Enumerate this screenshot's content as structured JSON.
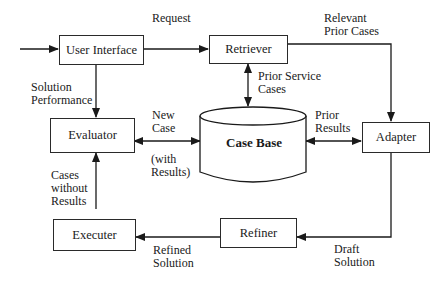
{
  "diagram": {
    "nodes": {
      "user_interface": "User Interface",
      "retriever": "Retriever",
      "evaluator": "Evaluator",
      "case_base": "Case Base",
      "adapter": "Adapter",
      "executer": "Executer",
      "refiner": "Refiner"
    },
    "edges": {
      "request": "Request",
      "relevant_prior_cases_1": "Relevant",
      "relevant_prior_cases_2": "Prior Cases",
      "prior_service_cases_1": "Prior Service",
      "prior_service_cases_2": "Cases",
      "solution_performance_1": "Solution",
      "solution_performance_2": "Performance",
      "new_case_1": "New",
      "new_case_2": "Case",
      "with_results_1": "(with",
      "with_results_2": "Results)",
      "prior_results_1": "Prior",
      "prior_results_2": "Results",
      "cases_without_results_1": "Cases",
      "cases_without_results_2": "without",
      "cases_without_results_3": "Results",
      "refined_solution_1": "Refined",
      "refined_solution_2": "Solution",
      "draft_solution_1": "Draft",
      "draft_solution_2": "Solution"
    }
  }
}
